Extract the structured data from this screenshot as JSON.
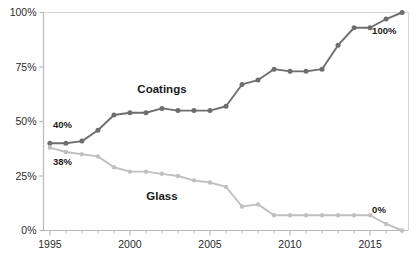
{
  "chart_data": {
    "type": "line",
    "title": "",
    "subtitle": "",
    "xlabel": "",
    "ylabel": "",
    "x": [
      1995,
      1996,
      1997,
      1998,
      1999,
      2000,
      2001,
      2002,
      2003,
      2004,
      2005,
      2006,
      2007,
      2008,
      2009,
      2010,
      2011,
      2012,
      2013,
      2014,
      2015,
      2016,
      2017
    ],
    "xlim": [
      1994.6,
      2017.4
    ],
    "ylim": [
      0,
      100
    ],
    "xticks": [
      1995,
      2000,
      2005,
      2010,
      2015
    ],
    "xtick_labels": [
      "1995",
      "2000",
      "2005",
      "2010",
      "2015"
    ],
    "yticks": [
      0,
      25,
      50,
      75,
      100
    ],
    "ytick_labels": [
      "0%",
      "25%",
      "50%",
      "75%",
      "100%"
    ],
    "grid": false,
    "legend": "inline-series-labels",
    "series": [
      {
        "name": "Coatings",
        "color": "#6e6e6e",
        "values": [
          40,
          40,
          41,
          46,
          53,
          54,
          54,
          56,
          55,
          55,
          55,
          57,
          67,
          69,
          74,
          73,
          73,
          74,
          85,
          93,
          93,
          97,
          100
        ]
      },
      {
        "name": "Glass",
        "color": "#c0c0c0",
        "values": [
          38,
          36,
          35,
          34,
          29,
          27,
          27,
          26,
          25,
          23,
          22,
          20,
          11,
          12,
          7,
          7,
          7,
          7,
          7,
          7,
          7,
          3,
          0
        ]
      }
    ],
    "series_labels": [
      {
        "text": "Coatings",
        "x": 2002,
        "y": 63
      },
      {
        "text": "Glass",
        "x": 2002,
        "y": 14
      }
    ],
    "annotations": [
      {
        "text": "40%",
        "x": 1995,
        "y": 47,
        "align": "left"
      },
      {
        "text": "38%",
        "x": 1995,
        "y": 30,
        "align": "left"
      },
      {
        "text": "100%",
        "x": 2017,
        "y": 90,
        "align": "right"
      },
      {
        "text": "0%",
        "x": 2017,
        "y": 8,
        "align": "right"
      }
    ],
    "axis_color": "#b9b9b9",
    "text_color": "#2b2b2b"
  }
}
